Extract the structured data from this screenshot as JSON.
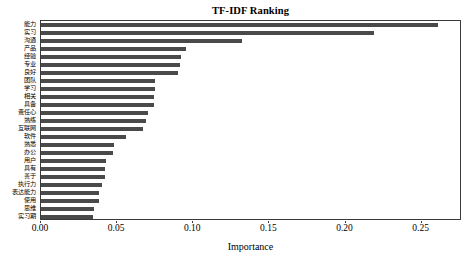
{
  "chart_data": {
    "type": "bar",
    "orientation": "horizontal",
    "title": "TF-IDF Ranking",
    "xlabel": "Importance",
    "ylabel": "",
    "xlim": [
      0.0,
      0.2765
    ],
    "grid": false,
    "legend": null,
    "bar_color": "#4a4a4a",
    "frame_color": "#3a3a3a",
    "background_color": "#ffffff",
    "xticks": [
      {
        "value": 0.0,
        "label": "0.00"
      },
      {
        "value": 0.05,
        "label": "0.05"
      },
      {
        "value": 0.1,
        "label": "0.10"
      },
      {
        "value": 0.15,
        "label": "0.15"
      },
      {
        "value": 0.2,
        "label": "0.20"
      },
      {
        "value": 0.25,
        "label": "0.25"
      }
    ],
    "categories": [
      "能力",
      "实习",
      "沟通",
      "产品",
      "经验",
      "专业",
      "良好",
      "团队",
      "学习",
      "相关",
      "具备",
      "责任心",
      "熟练",
      "互联网",
      "软件",
      "熟悉",
      "办公",
      "用户",
      "具有",
      "善于",
      "执行力",
      "表达能力",
      "使用",
      "思维",
      "实习期"
    ],
    "values": [
      0.261,
      0.219,
      0.132,
      0.095,
      0.092,
      0.091,
      0.09,
      0.075,
      0.075,
      0.074,
      0.074,
      0.07,
      0.069,
      0.067,
      0.056,
      0.048,
      0.047,
      0.043,
      0.042,
      0.042,
      0.04,
      0.038,
      0.038,
      0.035,
      0.034
    ]
  }
}
